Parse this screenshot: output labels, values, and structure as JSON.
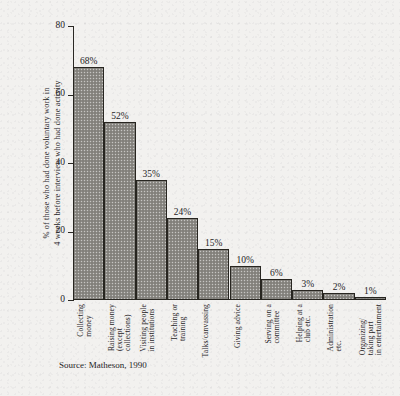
{
  "chart_data": {
    "type": "bar",
    "title": "",
    "subtitle": "",
    "xlabel": "",
    "ylabel": "% of those who had done voluntary work in\n4 weeks before interview who had done activity",
    "ylim": [
      0,
      80
    ],
    "yticks": [
      0,
      20,
      40,
      60,
      80
    ],
    "ytick_labels": [
      "0",
      "20",
      "40",
      "60",
      "80"
    ],
    "grid": false,
    "legend": "none",
    "value_suffix": "%",
    "categories": [
      "Collecting\nmoney",
      "Raising money\n(except\ncollections)",
      "Visiting people\nin institutions",
      "Teaching or\ntraining",
      "Talks/canvassing",
      "Giving advice",
      "Serving on a\ncommittee",
      "Helping at a\nclub etc.",
      "Administration\netc.",
      "Organizing/\ntaking part\nin entertainment"
    ],
    "values": [
      68,
      52,
      35,
      24,
      15,
      10,
      6,
      3,
      2,
      1
    ],
    "value_labels": [
      "68%",
      "52%",
      "35%",
      "24%",
      "15%",
      "10%",
      "6%",
      "3%",
      "2%",
      "1%"
    ],
    "bar_fill_color": "#8d8b86",
    "bar_edge_color": "#272520",
    "axis_color": "#2a2824",
    "background_color": "#f2f1ef"
  },
  "source": {
    "note": "Source: Matheson, 1990"
  }
}
